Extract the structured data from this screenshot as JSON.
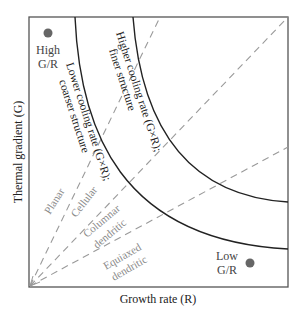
{
  "diagram": {
    "x_axis_label": "Growth rate (R)",
    "y_axis_label": "Thermal gradient (G)",
    "corner_labels": {
      "high": {
        "line1": "High",
        "line2": "G/R"
      },
      "low": {
        "line1": "Low",
        "line2": "G/R"
      }
    },
    "curves": {
      "inner": {
        "line1": "Lower cooling rate (G×R);",
        "line2": "coarser structure"
      },
      "outer": {
        "line1": "Higher cooling rate (G×R);",
        "line2": "finer structure"
      }
    },
    "regions": {
      "planar": "Planar",
      "cellular": "Cellular",
      "columnar_line1": "Columnar",
      "columnar_line2": "dendritic",
      "equiaxed_line1": "Equiaxed",
      "equiaxed_line2": "dendritic"
    },
    "colors": {
      "frame": "#444444",
      "curve": "#222222",
      "dash": "#999999",
      "region_text": "#8a8a8a",
      "marker": "#666666",
      "text": "#222222"
    }
  }
}
